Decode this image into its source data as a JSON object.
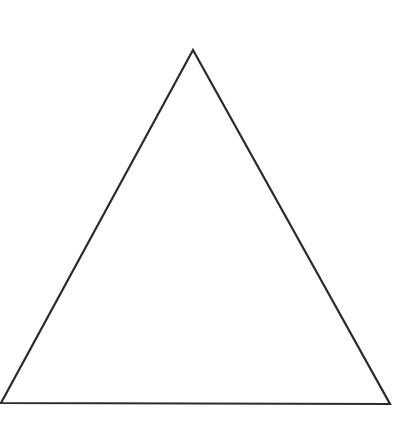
{
  "canvas": {
    "width": 417,
    "height": 423,
    "background_color": "#ffffff",
    "title": "Triangle Figure"
  },
  "figure": {
    "name": "triangle",
    "shape_type": "triangle",
    "stroke_color": "#2b2b2b",
    "stroke_width": 2.2,
    "fill_color": "none",
    "vertices": [
      {
        "label": "apex",
        "x": 193,
        "y": 50
      },
      {
        "label": "bottom-right",
        "x": 390,
        "y": 404
      },
      {
        "label": "bottom-left",
        "x": 1,
        "y": 403
      }
    ],
    "edges": [
      {
        "label": "left-side",
        "from": "bottom-left",
        "to": "apex"
      },
      {
        "label": "right-side",
        "from": "apex",
        "to": "bottom-right"
      },
      {
        "label": "base",
        "from": "bottom-right",
        "to": "bottom-left"
      }
    ],
    "points_attr": "193,50 390,404 1,403"
  }
}
